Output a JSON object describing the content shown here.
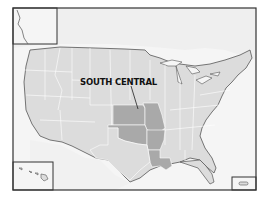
{
  "map": {
    "title": "United States regions map",
    "highlighted_region": {
      "label": "SOUTH CENTRAL",
      "states": [
        "Kansas",
        "Missouri",
        "Oklahoma",
        "Arkansas",
        "Louisiana"
      ]
    },
    "insets": [
      "Alaska",
      "Hawaii",
      "Puerto Rico"
    ],
    "colors": {
      "land": "#dcdcdc",
      "highlight": "#a9a9a9",
      "foreign_land": "#ececec",
      "water": "#f7f7f7",
      "border": "#ffffff",
      "coastline": "#555555",
      "frame": "#333333"
    }
  }
}
